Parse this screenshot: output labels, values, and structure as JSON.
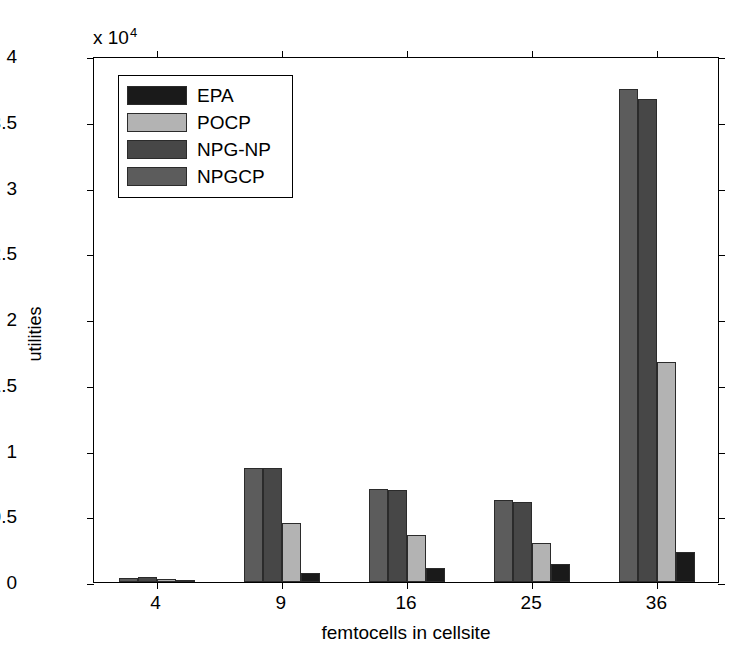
{
  "chart_data": {
    "type": "bar",
    "title": "",
    "xlabel": "femtocells in cellsite",
    "ylabel": "utilities",
    "exponent_label": "x 10",
    "exponent_power": "4",
    "y_scale_factor": 10000,
    "categories": [
      "4",
      "9",
      "16",
      "25",
      "36"
    ],
    "ylim": [
      0,
      40000
    ],
    "ytick_values": [
      0,
      5000,
      10000,
      15000,
      20000,
      25000,
      30000,
      35000,
      40000
    ],
    "ytick_labels": [
      "0",
      "0.5",
      "1",
      "1.5",
      "2",
      "2.5",
      "3",
      "3.5",
      "4"
    ],
    "grid": false,
    "legend_position": "upper-left",
    "bar_draw_order": [
      "NPGCP",
      "NPG-NP",
      "POCP",
      "EPA"
    ],
    "series": [
      {
        "name": "EPA",
        "color": "#1a1a1a",
        "values": [
          100,
          700,
          1100,
          1350,
          2300
        ]
      },
      {
        "name": "POCP",
        "color": "#b3b3b3",
        "values": [
          200,
          4450,
          3550,
          2950,
          16700
        ]
      },
      {
        "name": "NPG-NP",
        "color": "#474747",
        "values": [
          350,
          8700,
          7000,
          6050,
          36700
        ]
      },
      {
        "name": "NPGCP",
        "color": "#5c5c5c",
        "values": [
          300,
          8700,
          7100,
          6200,
          37500
        ]
      }
    ]
  },
  "legend": {
    "items": [
      {
        "label": "EPA",
        "color": "#1a1a1a"
      },
      {
        "label": "POCP",
        "color": "#b3b3b3"
      },
      {
        "label": "NPG-NP",
        "color": "#474747"
      },
      {
        "label": "NPGCP",
        "color": "#5c5c5c"
      }
    ]
  }
}
